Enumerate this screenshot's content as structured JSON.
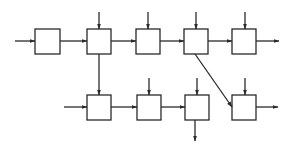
{
  "diagram": {
    "title": "",
    "stroke_color": "#2a2a2a",
    "background": "#ffffff",
    "blocks": [
      {
        "id": "A",
        "row": "top",
        "x": 35,
        "y": 29,
        "w": 25,
        "h": 25,
        "label": ""
      },
      {
        "id": "B",
        "row": "top",
        "x": 87,
        "y": 29,
        "w": 24,
        "h": 25,
        "label": ""
      },
      {
        "id": "C",
        "row": "top",
        "x": 136,
        "y": 29,
        "w": 24,
        "h": 25,
        "label": ""
      },
      {
        "id": "D",
        "row": "top",
        "x": 184,
        "y": 29,
        "w": 24,
        "h": 25,
        "label": ""
      },
      {
        "id": "E",
        "row": "top",
        "x": 232,
        "y": 29,
        "w": 24,
        "h": 25,
        "label": ""
      },
      {
        "id": "F",
        "row": "bottom",
        "x": 87,
        "y": 95,
        "w": 24,
        "h": 25,
        "label": ""
      },
      {
        "id": "G",
        "row": "bottom",
        "x": 137,
        "y": 95,
        "w": 24,
        "h": 25,
        "label": ""
      },
      {
        "id": "H",
        "row": "bottom",
        "x": 185,
        "y": 95,
        "w": 24,
        "h": 25,
        "label": ""
      },
      {
        "id": "I",
        "row": "bottom",
        "x": 232,
        "y": 95,
        "w": 24,
        "h": 25,
        "label": ""
      }
    ],
    "connections": [
      {
        "from": "input",
        "to": "A",
        "kind": "external-input-left"
      },
      {
        "from": "A",
        "to": "B",
        "kind": "series"
      },
      {
        "from": "B",
        "to": "C",
        "kind": "series"
      },
      {
        "from": "C",
        "to": "D",
        "kind": "series"
      },
      {
        "from": "D",
        "to": "E",
        "kind": "series"
      },
      {
        "from": "E",
        "to": "output",
        "kind": "external-output-right"
      },
      {
        "from": "B",
        "to": "F",
        "kind": "branch-down"
      },
      {
        "from": "D",
        "to": "I",
        "kind": "diagonal-branch"
      },
      {
        "from": "input",
        "to": "F",
        "kind": "external-input-left"
      },
      {
        "from": "F",
        "to": "G",
        "kind": "series"
      },
      {
        "from": "G",
        "to": "H",
        "kind": "series"
      },
      {
        "from": "H",
        "to": "output",
        "kind": "external-output-down"
      },
      {
        "from": "I",
        "to": "output",
        "kind": "external-output-right"
      },
      {
        "from": "input",
        "to": "B",
        "kind": "external-input-top"
      },
      {
        "from": "input",
        "to": "C",
        "kind": "external-input-top"
      },
      {
        "from": "input",
        "to": "D",
        "kind": "external-input-top"
      },
      {
        "from": "input",
        "to": "E",
        "kind": "external-input-top"
      },
      {
        "from": "input",
        "to": "G",
        "kind": "external-input-top"
      },
      {
        "from": "input",
        "to": "H",
        "kind": "external-input-top"
      },
      {
        "from": "input",
        "to": "I",
        "kind": "external-input-top"
      }
    ]
  }
}
